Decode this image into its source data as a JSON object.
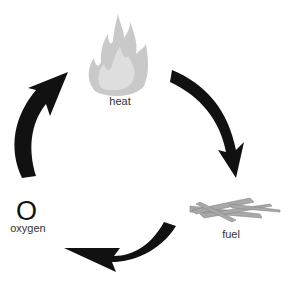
{
  "diagram": {
    "nodes": [
      {
        "id": "heat",
        "label": "heat",
        "icon": "flame-icon"
      },
      {
        "id": "fuel",
        "label": "fuel",
        "icon": "sticks-icon"
      },
      {
        "id": "oxygen",
        "label": "oxygen",
        "symbol": "O"
      }
    ],
    "arrows": [
      "heat-to-fuel",
      "fuel-to-bottom",
      "bottom-to-oxygen",
      "oxygen-to-heat"
    ],
    "colors": {
      "arrow": "#111111",
      "flame": "#c8c8c8",
      "sticks": "#a0a0a0",
      "text": "#333333"
    }
  }
}
